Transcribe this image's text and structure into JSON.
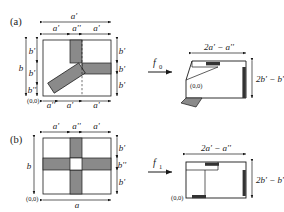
{
  "figure": {
    "background": "#ffffff",
    "stroke": "#1a1a1a",
    "fill_gray": "#8a8a8a",
    "fill_dark": "#4a4a4a",
    "width": 284,
    "height": 212
  },
  "panels": [
    {
      "id": "a",
      "label": "(a)",
      "map_label": "f",
      "map_sub": "0",
      "source": {
        "origin_label": "(0,0)",
        "top_total_label": "a'",
        "top_segments": [
          "a'",
          "a''",
          "a'"
        ],
        "left_total_label": "b",
        "left_segments": [
          "b'",
          "b'",
          "b''"
        ],
        "right_segments": [
          "b'",
          "b'",
          "b'"
        ],
        "bottom_segments": [
          "a''",
          "a'",
          "a'"
        ]
      },
      "target": {
        "origin_label": "(0,0)",
        "width_label": "2a' − a''",
        "height_label": "2b' − b''"
      }
    },
    {
      "id": "b",
      "label": "(b)",
      "map_label": "f",
      "map_sub": "1",
      "source": {
        "origin_label": "(0,0)",
        "top_segments": [
          "a'",
          "a''",
          "a'"
        ],
        "left_total_label": "b",
        "right_segments": [
          "b'",
          "b''",
          "b'"
        ],
        "bottom_total_label": "a"
      },
      "target": {
        "origin_label": "(0,0)",
        "width_label": "2a' − a''",
        "height_label": "2b' − b''"
      }
    }
  ]
}
